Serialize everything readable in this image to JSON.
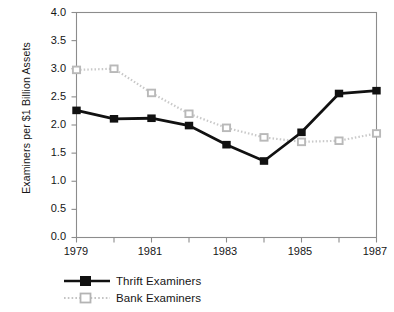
{
  "chart_data": {
    "type": "line",
    "title": "",
    "xlabel": "",
    "ylabel": "Examiners per $1 Billion Assets",
    "x": [
      1979,
      1980,
      1981,
      1982,
      1983,
      1984,
      1985,
      1986,
      1987
    ],
    "categories": [
      "1979",
      "1980",
      "1981",
      "1982",
      "1983",
      "1984",
      "1985",
      "1986",
      "1987"
    ],
    "xlim": [
      1979,
      1987
    ],
    "ylim": [
      0.0,
      4.0
    ],
    "ytick_labels": [
      "0.0",
      "0.5",
      "1.0",
      "1.5",
      "2.0",
      "2.5",
      "3.0",
      "3.5",
      "4.0"
    ],
    "ytick_values": [
      0.0,
      0.5,
      1.0,
      1.5,
      2.0,
      2.5,
      3.0,
      3.5,
      4.0
    ],
    "xtick_values": [
      1979,
      1980,
      1981,
      1982,
      1983,
      1984,
      1985,
      1986,
      1987
    ],
    "xtick_labels_shown": [
      "1979",
      "",
      "1981",
      "",
      "1983",
      "",
      "1985",
      "",
      "1987"
    ],
    "grid": false,
    "legend_position": "below-left",
    "series": [
      {
        "name": "Thrift Examiners",
        "color": "#111111",
        "linestyle": "solid",
        "marker": "square",
        "values": [
          2.26,
          2.11,
          2.12,
          1.99,
          1.65,
          1.36,
          1.87,
          2.56,
          2.61
        ]
      },
      {
        "name": "Bank Examiners",
        "color": "#c9c9c9",
        "linestyle": "dotted",
        "marker": "square-open",
        "values": [
          2.98,
          3.0,
          2.57,
          2.2,
          1.95,
          1.78,
          1.7,
          1.72,
          1.85
        ]
      }
    ]
  },
  "legend": {
    "items": [
      {
        "label": "Thrift Examiners"
      },
      {
        "label": "Bank Examiners"
      }
    ]
  },
  "axes": {
    "frame_color": "#8c8c8c"
  }
}
